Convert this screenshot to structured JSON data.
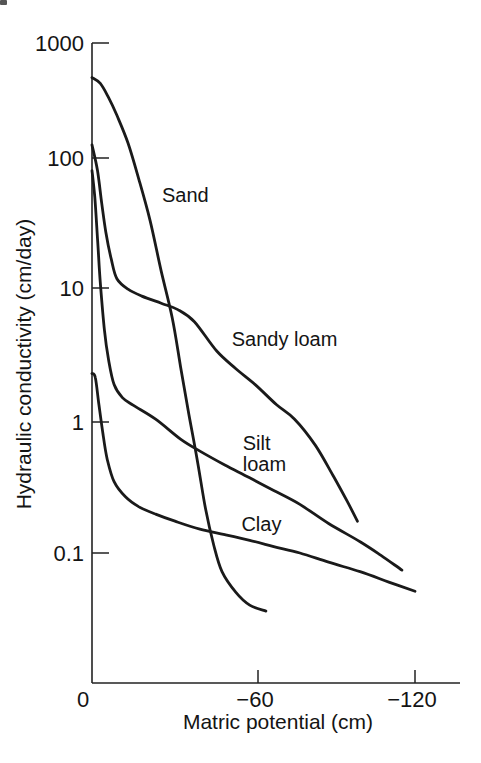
{
  "figure": {
    "background": "#ffffff",
    "ink_color": "#1a1a1a",
    "axis_color": "#222222"
  },
  "chart_data": {
    "type": "line",
    "title": "",
    "xlabel": "Matric potential (cm)",
    "ylabel": "Hydraulic conductivity (cm/day)",
    "y_scale": "log",
    "x_range": [
      0,
      -133
    ],
    "y_range": [
      0.01,
      1000
    ],
    "grid": false,
    "legend": "inline-labels",
    "x_ticks": [
      {
        "value": 0,
        "label": "0"
      },
      {
        "value": -60,
        "label": "−60"
      },
      {
        "value": -120,
        "label": "−120"
      }
    ],
    "y_ticks": [
      {
        "value": 1000,
        "label": "1000"
      },
      {
        "value": 100,
        "label": "100"
      },
      {
        "value": 10,
        "label": "10"
      },
      {
        "value": 1,
        "label": "1"
      },
      {
        "value": 0.1,
        "label": "0.1"
      }
    ],
    "series": [
      {
        "name": "Sand",
        "points": [
          [
            0,
            500
          ],
          [
            -3,
            445
          ],
          [
            -6,
            335
          ],
          [
            -9,
            235
          ],
          [
            -13,
            135
          ],
          [
            -17,
            68
          ],
          [
            -21,
            33
          ],
          [
            -25,
            13.5
          ],
          [
            -29,
            6.0
          ],
          [
            -32,
            2.6
          ],
          [
            -35,
            1.15
          ],
          [
            -38,
            0.52
          ],
          [
            -41,
            0.22
          ],
          [
            -44,
            0.115
          ],
          [
            -47,
            0.072
          ],
          [
            -52,
            0.05
          ],
          [
            -57,
            0.04
          ],
          [
            -63,
            0.036
          ]
        ]
      },
      {
        "name": "Sandy loam",
        "points": [
          [
            0,
            130
          ],
          [
            -2,
            80
          ],
          [
            -3.5,
            45
          ],
          [
            -5,
            27
          ],
          [
            -7,
            16.5
          ],
          [
            -9,
            11.8
          ],
          [
            -13,
            9.8
          ],
          [
            -18,
            8.7
          ],
          [
            -25,
            7.7
          ],
          [
            -31,
            6.9
          ],
          [
            -37,
            5.6
          ],
          [
            -45,
            3.4
          ],
          [
            -52,
            2.5
          ],
          [
            -59,
            1.9
          ],
          [
            -67,
            1.35
          ],
          [
            -74,
            1.05
          ],
          [
            -82,
            0.66
          ],
          [
            -89,
            0.38
          ],
          [
            -94,
            0.25
          ],
          [
            -98,
            0.175
          ]
        ]
      },
      {
        "name": "Silt loam",
        "points": [
          [
            0,
            80
          ],
          [
            -1,
            50
          ],
          [
            -2,
            24
          ],
          [
            -3,
            11
          ],
          [
            -4.5,
            4.8
          ],
          [
            -6,
            2.9
          ],
          [
            -8,
            1.9
          ],
          [
            -11,
            1.52
          ],
          [
            -15,
            1.33
          ],
          [
            -23,
            1.05
          ],
          [
            -32,
            0.74
          ],
          [
            -39,
            0.6
          ],
          [
            -48,
            0.47
          ],
          [
            -57,
            0.375
          ],
          [
            -66,
            0.3
          ],
          [
            -76,
            0.235
          ],
          [
            -87,
            0.168
          ],
          [
            -99,
            0.122
          ],
          [
            -107,
            0.096
          ],
          [
            -115,
            0.074
          ]
        ]
      },
      {
        "name": "Clay",
        "points": [
          [
            0,
            2.3
          ],
          [
            -1.2,
            2.15
          ],
          [
            -2.5,
            1.35
          ],
          [
            -4,
            0.8
          ],
          [
            -5.5,
            0.52
          ],
          [
            -8,
            0.35
          ],
          [
            -12,
            0.27
          ],
          [
            -17,
            0.225
          ],
          [
            -23,
            0.198
          ],
          [
            -30,
            0.175
          ],
          [
            -39,
            0.152
          ],
          [
            -48,
            0.138
          ],
          [
            -57,
            0.125
          ],
          [
            -66,
            0.112
          ],
          [
            -76,
            0.1
          ],
          [
            -87,
            0.085
          ],
          [
            -99,
            0.072
          ],
          [
            -110,
            0.06
          ],
          [
            -120,
            0.051
          ]
        ]
      }
    ],
    "annotations": [
      {
        "text": "Sand",
        "psi": -25.3,
        "k": 53
      },
      {
        "text": "Sandy loam",
        "psi": -50.5,
        "k": 4.2
      },
      {
        "text": "Silt\nloam",
        "psi": -54.5,
        "k": 0.7
      },
      {
        "text": "Clay",
        "psi": -54,
        "k": 0.17
      }
    ]
  }
}
